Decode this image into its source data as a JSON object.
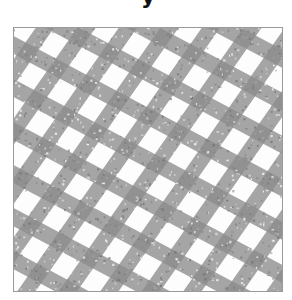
{
  "title": {
    "visible_text": "y"
  },
  "image": {
    "description": "Grayscale photograph of a crossed diagonal lattice / mesh pattern",
    "band_color": "#8c8c8c",
    "band_dark": "#6f6f6f",
    "background_color": "#fdfdfd",
    "border_color": "#9a9a9a",
    "families": [
      {
        "name": "shallow-down-right",
        "angle_deg": 28,
        "spacing_px": 38,
        "width_px": 16
      },
      {
        "name": "steep-up-right",
        "angle_deg": -55,
        "spacing_px": 34,
        "width_px": 15
      }
    ]
  }
}
